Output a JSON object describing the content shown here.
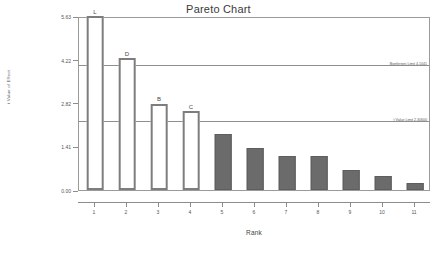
{
  "chart_data": {
    "type": "bar",
    "title": "Pareto Chart",
    "xlabel": "Rank",
    "ylabel": "t Value of Effect",
    "categories": [
      "1",
      "2",
      "3",
      "4",
      "5",
      "6",
      "7",
      "8",
      "9",
      "10",
      "11"
    ],
    "values": [
      5.63,
      4.27,
      2.79,
      2.55,
      1.8,
      1.37,
      1.1,
      1.1,
      0.65,
      0.44,
      0.24
    ],
    "point_labels": [
      "L",
      "D",
      "B",
      "C",
      "",
      "",
      "",
      "",
      "",
      "",
      ""
    ],
    "bar_styles": [
      "hollow",
      "hollow",
      "hollow",
      "hollow",
      "solid",
      "solid",
      "solid",
      "solid",
      "solid",
      "solid",
      "solid"
    ],
    "ylim": [
      0.0,
      5.63
    ],
    "yticks": [
      0.0,
      1.41,
      2.82,
      4.22,
      5.63
    ],
    "ytick_labels": [
      "0.00",
      "1.41",
      "2.82",
      "4.22",
      "5.63"
    ],
    "grid": false,
    "legend": "none",
    "reference_lines": [
      {
        "name": "bonferroni-limit",
        "value": 4.1041,
        "label": "Bonferroni Limit 4.1041"
      },
      {
        "name": "t-value-limit",
        "value": 2.306,
        "label": "t Value Limit 2.30600"
      }
    ],
    "colors": {
      "hollow_bar_fill": "#ffffff",
      "hollow_bar_border": "#7d7d7d",
      "solid_bar_fill": "#6b6b6b",
      "solid_bar_border": "#5e5e5e",
      "axis": "#8d8d8d",
      "reference_line": "#8d8d8d",
      "text": "#4a4a4a",
      "background": "#ffffff"
    }
  }
}
